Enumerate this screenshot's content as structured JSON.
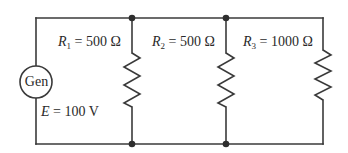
{
  "diagram": {
    "type": "parallel-resistor-circuit",
    "colors": {
      "wire": "#3a3a3a",
      "node": "#2e2e2e",
      "text": "#2a2a2a",
      "background": "#ffffff"
    },
    "generator": {
      "label": "Gen",
      "emf_symbol": "E",
      "emf_value": "= 100 V"
    },
    "resistors": [
      {
        "symbol": "R",
        "subscript": "1",
        "value": "= 500 Ω"
      },
      {
        "symbol": "R",
        "subscript": "2",
        "value": "= 500 Ω"
      },
      {
        "symbol": "R",
        "subscript": "3",
        "value": "= 1000 Ω"
      }
    ]
  }
}
